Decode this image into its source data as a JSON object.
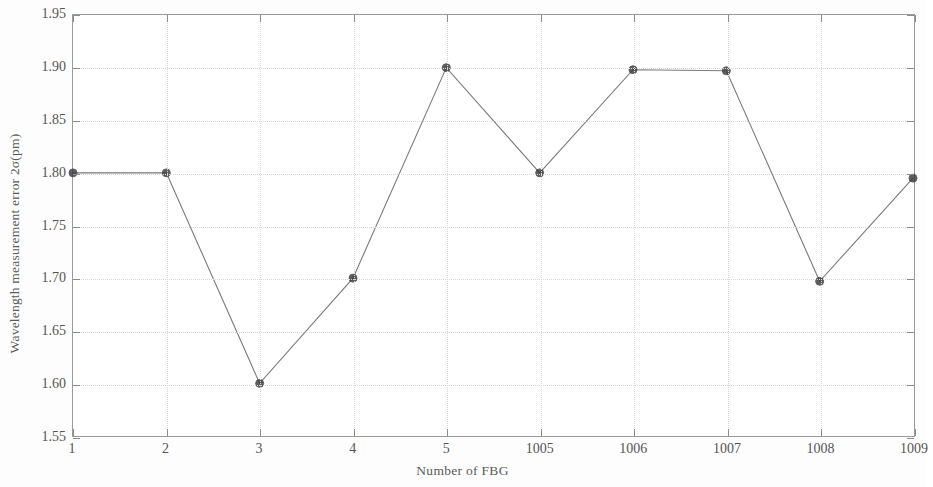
{
  "chart_data": {
    "type": "line",
    "title": "",
    "xlabel": "Number of FBG",
    "ylabel": "Wavelength measurement error 2σ(pm)",
    "categories": [
      "1",
      "2",
      "3",
      "4",
      "5",
      "1005",
      "1006",
      "1007",
      "1008",
      "1009"
    ],
    "values": [
      1.8,
      1.8,
      1.6,
      1.7,
      1.9,
      1.8,
      1.898,
      1.897,
      1.697,
      1.795
    ],
    "ylim": [
      1.55,
      1.95
    ],
    "ytick_labels": [
      "1.95",
      "1.90",
      "1.85",
      "1.80",
      "1.75",
      "1.70",
      "1.65",
      "1.60",
      "1.55"
    ],
    "ytick_values": [
      1.95,
      1.9,
      1.85,
      1.8,
      1.75,
      1.7,
      1.65,
      1.6,
      1.55
    ],
    "xtick_labels": [
      "1",
      "2",
      "3",
      "4",
      "5",
      "1005",
      "1006",
      "1007",
      "1008",
      "1009"
    ],
    "grid": true,
    "legend": "none",
    "series": [
      {
        "name": "Wavelength measurement error",
        "values": [
          1.8,
          1.8,
          1.6,
          1.7,
          1.9,
          1.8,
          1.898,
          1.897,
          1.697,
          1.795
        ]
      }
    ]
  },
  "style": {
    "line_color": "#7a7a7a",
    "marker_color": "#3a3a3a",
    "axis_color": "#8c8c8c",
    "grid_color": "#d8d8d8",
    "text_color": "#555555",
    "background": "#ffffff"
  }
}
